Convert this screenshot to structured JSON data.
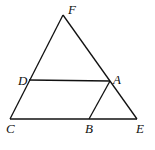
{
  "diagram": {
    "type": "geometry",
    "points": {
      "F": {
        "x": 63,
        "y": 15,
        "label": "F",
        "lx": 68,
        "ly": 14
      },
      "D": {
        "x": 29,
        "y": 80,
        "label": "D",
        "lx": 18,
        "ly": 85
      },
      "A": {
        "x": 110,
        "y": 81,
        "label": "A",
        "lx": 113,
        "ly": 84
      },
      "C": {
        "x": 10,
        "y": 119,
        "label": "C",
        "lx": 6,
        "ly": 133
      },
      "B": {
        "x": 89,
        "y": 119,
        "label": "B",
        "lx": 85,
        "ly": 133
      },
      "E": {
        "x": 137,
        "y": 119,
        "label": "E",
        "lx": 136,
        "ly": 133
      }
    },
    "segments": [
      [
        "F",
        "C"
      ],
      [
        "F",
        "E"
      ],
      [
        "C",
        "E"
      ],
      [
        "D",
        "A"
      ],
      [
        "A",
        "B"
      ]
    ]
  }
}
